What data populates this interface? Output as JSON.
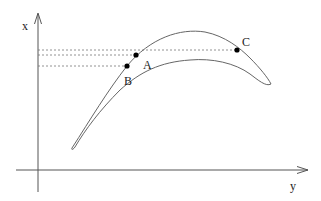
{
  "diagram": {
    "axes": {
      "vertical_label": "x",
      "horizontal_label": "y"
    },
    "points": [
      {
        "label": "A",
        "x": 136,
        "y": 55
      },
      {
        "label": "B",
        "x": 127,
        "y": 66
      },
      {
        "label": "C",
        "x": 237,
        "y": 50
      }
    ],
    "colors": {
      "curve": "#666666",
      "axis": "#555555",
      "dots": "#000000",
      "guides": "#777777"
    }
  }
}
